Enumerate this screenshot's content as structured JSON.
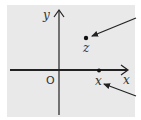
{
  "diagram": {
    "background_color": "#e9e9e9",
    "axis_color": "#222222",
    "labels": {
      "y_axis": "y",
      "x_axis": "x",
      "origin": "O",
      "point_z": "z",
      "point_x": "x"
    },
    "points": [
      {
        "name": "z",
        "cx": 86,
        "cy": 38
      },
      {
        "name": "x",
        "cx": 99,
        "cy": 71
      }
    ],
    "pointer_arrows": [
      {
        "target": "z",
        "from": [
          136,
          18
        ],
        "to": [
          92,
          36
        ]
      },
      {
        "target": "x",
        "from": [
          136,
          96
        ],
        "to": [
          104,
          84
        ]
      }
    ]
  }
}
